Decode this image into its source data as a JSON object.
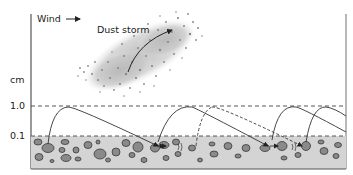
{
  "diagram": {
    "wind_label": "Wind",
    "dust_storm_label": "Dust storm",
    "axis_unit_label": "cm",
    "levels": [
      {
        "label": "1.0",
        "y": 106
      },
      {
        "label": "0.1",
        "y": 136
      }
    ],
    "colors": {
      "ground_fill": "#d4d4d4",
      "pebble_fill": "#8a8a8a",
      "pebble_stroke": "#3a3a3a",
      "dust_cloud": "#bdbdbd",
      "line": "#333333"
    }
  }
}
